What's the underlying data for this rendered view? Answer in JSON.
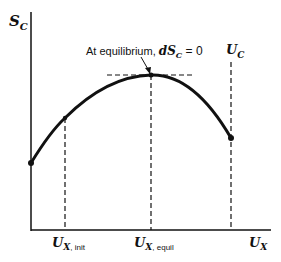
{
  "diagram": {
    "y_axis_label": {
      "main": "S",
      "sub": "C"
    },
    "x_axis_label": {
      "main": "U",
      "sub": "X"
    },
    "annotation": {
      "text": "At equilibrium, ",
      "math_main": "dS",
      "math_sub": "C",
      "math_tail": " = 0"
    },
    "boundary_label": {
      "main": "U",
      "sub": "C"
    },
    "x_ticks": [
      {
        "main": "U",
        "sub_var": "X",
        "sub_text": ", init"
      },
      {
        "main": "U",
        "sub_var": "X",
        "sub_text": ", equil"
      }
    ],
    "colors": {
      "ink": "#111111",
      "background": "#ffffff"
    }
  }
}
